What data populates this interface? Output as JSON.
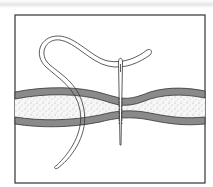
{
  "figure": {
    "elements": [
      "frame",
      "fabric-layer",
      "thread",
      "needle"
    ],
    "colors": {
      "line": "#333333",
      "fabric_band": "#8a8a8a",
      "fabric_fill": "#f2f2f2",
      "background": "#ffffff"
    }
  }
}
